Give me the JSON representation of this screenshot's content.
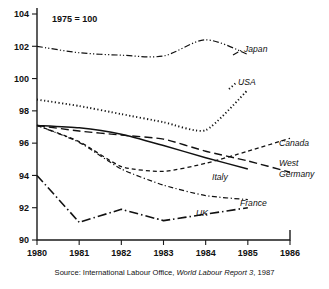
{
  "chart_data": {
    "type": "line",
    "title": "",
    "annotation": "1975 = 100",
    "xlabel": "",
    "ylabel": "",
    "xlim": [
      1980,
      1986
    ],
    "ylim": [
      90,
      104
    ],
    "x_ticks": [
      "1980",
      "1981",
      "1982",
      "1983",
      "1984",
      "1985",
      "1986"
    ],
    "y_ticks": [
      "90",
      "92",
      "94",
      "96",
      "98",
      "100",
      "102",
      "104"
    ],
    "grid": false,
    "legend_position": "right-inline-labels",
    "x": [
      1980,
      1981,
      1982,
      1983,
      1984,
      1985
    ],
    "series": [
      {
        "name": "Japan",
        "label": "Japan",
        "line_style": "dash-dot-dot",
        "x": [
          1980,
          1981,
          1982,
          1983,
          1984,
          1985
        ],
        "values": [
          102.0,
          101.6,
          101.45,
          101.4,
          102.4,
          101.5
        ]
      },
      {
        "name": "USA",
        "label": "USA",
        "line_style": "dotted",
        "x": [
          1980,
          1981,
          1982,
          1983,
          1984,
          1985
        ],
        "values": [
          98.7,
          98.3,
          97.8,
          97.3,
          96.8,
          99.3
        ]
      },
      {
        "name": "Canada",
        "label": "Canada",
        "line_style": "short-dash",
        "x": [
          1980,
          1981,
          1982,
          1983,
          1984,
          1985,
          1986
        ],
        "values": [
          97.1,
          96.1,
          94.55,
          94.25,
          94.75,
          95.5,
          96.3
        ]
      },
      {
        "name": "West Germany",
        "label": "West Germany",
        "line_style": "long-dash",
        "x": [
          1980,
          1981,
          1982,
          1983,
          1984,
          1985,
          1986
        ],
        "values": [
          97.1,
          96.75,
          96.5,
          96.25,
          95.5,
          94.9,
          94.2
        ]
      },
      {
        "name": "Italy",
        "label": "Italy",
        "line_style": "solid",
        "x": [
          1980,
          1981,
          1982,
          1983,
          1984,
          1985
        ],
        "values": [
          97.1,
          96.95,
          96.55,
          95.85,
          95.1,
          94.4
        ]
      },
      {
        "name": "France",
        "label": "France",
        "line_style": "dash-dot",
        "x": [
          1980,
          1981,
          1982,
          1983,
          1984,
          1985
        ],
        "values": [
          97.1,
          96.05,
          94.4,
          93.4,
          92.75,
          92.5
        ]
      },
      {
        "name": "UK",
        "label": "UK",
        "line_style": "long-dash-dot",
        "x": [
          1980,
          1981,
          1982,
          1983,
          1984,
          1985
        ],
        "values": [
          94.0,
          91.1,
          91.9,
          91.2,
          91.6,
          92.0
        ]
      }
    ]
  },
  "source": {
    "prefix": "Source: International Labour Office,",
    "italic": "World Labour Report 3",
    "suffix": ", 1987"
  },
  "colors": {
    "ink": "#111111",
    "background": "#ffffff"
  }
}
